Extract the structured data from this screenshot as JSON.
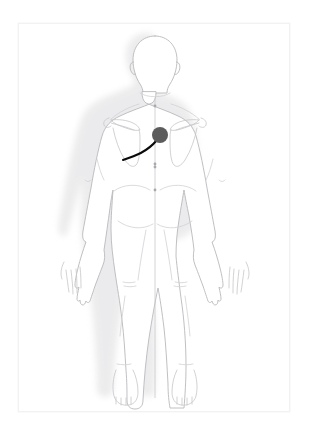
{
  "app": {
    "title": "Body Chart",
    "view_label": "Posterior (back) view",
    "caption": ""
  },
  "frame": {
    "name": "body-chart-frame",
    "background_color": "#ffffff",
    "border_color": "#f2f2f2"
  },
  "figure": {
    "name": "human-body-outline",
    "orientation": "posterior",
    "outline_color": "#b9b9bc",
    "detail_color": "#d2d2d6",
    "fill_color": "#ffffff",
    "shadow_color": "#e6e6e8",
    "regions": [
      {
        "id": "head",
        "label": "Head"
      },
      {
        "id": "neck",
        "label": "Neck"
      },
      {
        "id": "left-shoulder",
        "label": "Left shoulder"
      },
      {
        "id": "right-shoulder",
        "label": "Right shoulder"
      },
      {
        "id": "left-scapula",
        "label": "Left scapula"
      },
      {
        "id": "right-scapula",
        "label": "Right scapula"
      },
      {
        "id": "upper-back",
        "label": "Upper back"
      },
      {
        "id": "lower-back",
        "label": "Lower back"
      },
      {
        "id": "left-arm",
        "label": "Left arm"
      },
      {
        "id": "right-arm",
        "label": "Right arm"
      },
      {
        "id": "left-hand",
        "label": "Left hand"
      },
      {
        "id": "right-hand",
        "label": "Right hand"
      },
      {
        "id": "buttocks",
        "label": "Buttocks"
      },
      {
        "id": "left-leg",
        "label": "Left leg"
      },
      {
        "id": "right-leg",
        "label": "Right leg"
      },
      {
        "id": "left-knee",
        "label": "Left knee"
      },
      {
        "id": "right-knee",
        "label": "Right knee"
      },
      {
        "id": "left-foot",
        "label": "Left foot"
      },
      {
        "id": "right-foot",
        "label": "Right foot"
      }
    ]
  },
  "midline": {
    "name": "spine-midline",
    "color": "#c9c9cd",
    "tick_color": "#a8a8ad",
    "ticks": 5
  },
  "annotations": {
    "marker": {
      "name": "pain-marker-dot",
      "label": "Pain point",
      "color": "#5c5c5c",
      "radius": 8,
      "x": 141,
      "y": 111
    },
    "pain_line": {
      "name": "pain-radiation-line",
      "label": "Radiating pain line",
      "color": "#0a0a0a",
      "width": 2.1,
      "path": "M 138 116 C 128 128, 116 132, 104 136"
    }
  }
}
